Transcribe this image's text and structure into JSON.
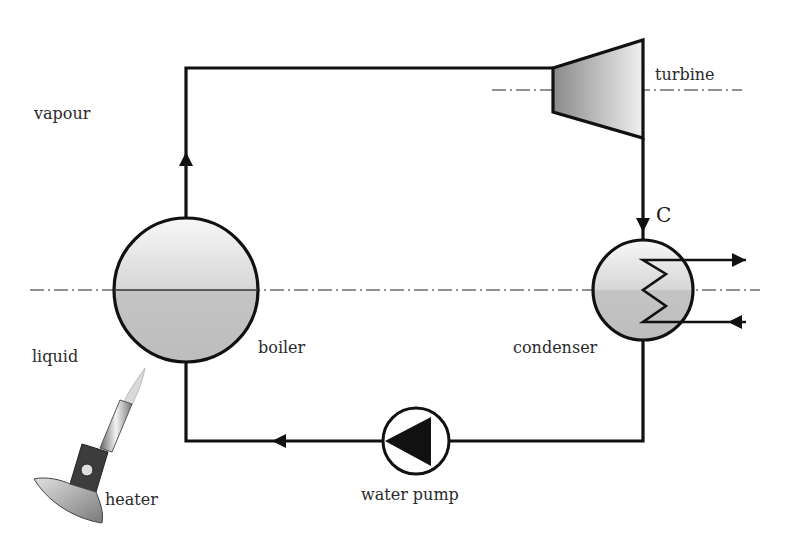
{
  "diagram": {
    "labels": {
      "vapour": "vapour",
      "liquid": "liquid",
      "boiler": "boiler",
      "turbine": "turbine",
      "condenser": "condenser",
      "water_pump": "water pump",
      "heater": "heater",
      "point_c": "C"
    },
    "components": [
      {
        "id": "boiler",
        "label": "boiler"
      },
      {
        "id": "turbine",
        "label": "turbine"
      },
      {
        "id": "condenser",
        "label": "condenser"
      },
      {
        "id": "water_pump",
        "label": "water pump"
      },
      {
        "id": "heater",
        "label": "heater"
      }
    ],
    "flow": [
      "boiler",
      "turbine",
      "condenser",
      "water pump",
      "boiler"
    ],
    "colors": {
      "line": "#111111",
      "fill_light": "#f2f2f2",
      "fill_dark": "#b8b8b8"
    }
  }
}
